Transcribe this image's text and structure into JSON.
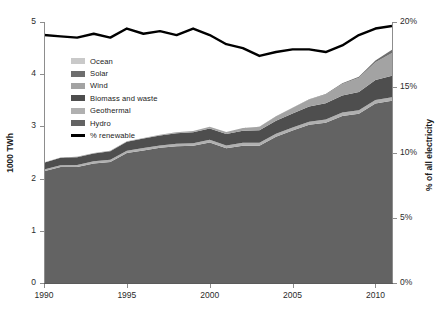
{
  "chart_data": {
    "type": "area",
    "title": "",
    "xlabel": "",
    "ylabel": "1000 TWh",
    "y2label": "% of all electricity",
    "xlim": [
      1990,
      2011
    ],
    "ylim": [
      0,
      5
    ],
    "y2lim": [
      0,
      20
    ],
    "grid": false,
    "legend_position": "upper-left-inside",
    "x": [
      1990,
      1991,
      1992,
      1993,
      1994,
      1995,
      1996,
      1997,
      1998,
      1999,
      2000,
      2001,
      2002,
      2003,
      2004,
      2005,
      2006,
      2007,
      2008,
      2009,
      2010,
      2011
    ],
    "xticks": [
      1990,
      1995,
      2000,
      2005,
      2010
    ],
    "xtick_labels": [
      "1990",
      "1995",
      "2000",
      "2005",
      "2010"
    ],
    "yticks": [
      0,
      1,
      2,
      3,
      4,
      5
    ],
    "ytick_labels": [
      "0",
      "1",
      "2",
      "3",
      "4",
      "5"
    ],
    "y2ticks": [
      0,
      5,
      10,
      15,
      20
    ],
    "y2tick_labels": [
      "0%",
      "5%",
      "10%",
      "15%",
      "20%"
    ],
    "stacked": true,
    "stack_order_bottom_to_top": [
      "Hydro",
      "Geothermal",
      "Biomass and waste",
      "Wind",
      "Solar",
      "Ocean"
    ],
    "series": [
      {
        "name": "Hydro",
        "color": "#636363",
        "axis": "left",
        "values": [
          2.14,
          2.22,
          2.22,
          2.29,
          2.32,
          2.49,
          2.54,
          2.59,
          2.62,
          2.63,
          2.69,
          2.58,
          2.63,
          2.63,
          2.8,
          2.92,
          3.03,
          3.07,
          3.2,
          3.24,
          3.44,
          3.49
        ]
      },
      {
        "name": "Geothermal",
        "color": "#b0b0b0",
        "axis": "left",
        "values": [
          0.036,
          0.038,
          0.04,
          0.042,
          0.043,
          0.045,
          0.046,
          0.046,
          0.048,
          0.049,
          0.052,
          0.053,
          0.055,
          0.056,
          0.057,
          0.058,
          0.06,
          0.062,
          0.064,
          0.067,
          0.068,
          0.069
        ]
      },
      {
        "name": "Biomass and waste",
        "color": "#4e4e4e",
        "axis": "left",
        "values": [
          0.13,
          0.14,
          0.15,
          0.15,
          0.16,
          0.17,
          0.18,
          0.19,
          0.2,
          0.21,
          0.22,
          0.22,
          0.23,
          0.24,
          0.25,
          0.27,
          0.29,
          0.31,
          0.33,
          0.35,
          0.38,
          0.41
        ]
      },
      {
        "name": "Wind",
        "color": "#a3a3a3",
        "axis": "left",
        "values": [
          0.004,
          0.005,
          0.006,
          0.007,
          0.008,
          0.01,
          0.011,
          0.013,
          0.017,
          0.022,
          0.031,
          0.038,
          0.052,
          0.064,
          0.085,
          0.104,
          0.133,
          0.171,
          0.22,
          0.276,
          0.342,
          0.437
        ]
      },
      {
        "name": "Solar",
        "color": "#6e6e6e",
        "axis": "left",
        "values": [
          0.0004,
          0.0004,
          0.0005,
          0.0005,
          0.0006,
          0.0006,
          0.0007,
          0.0008,
          0.0009,
          0.0011,
          0.0013,
          0.0016,
          0.002,
          0.0025,
          0.0032,
          0.0042,
          0.0057,
          0.0077,
          0.012,
          0.02,
          0.032,
          0.062
        ]
      },
      {
        "name": "Ocean",
        "color": "#c9c9c9",
        "axis": "left",
        "values": [
          0.0005,
          0.0005,
          0.0005,
          0.0005,
          0.0005,
          0.0005,
          0.0005,
          0.0005,
          0.0005,
          0.0005,
          0.0005,
          0.0005,
          0.0005,
          0.0005,
          0.0005,
          0.0005,
          0.0005,
          0.0005,
          0.0005,
          0.0005,
          0.0005,
          0.0005
        ]
      },
      {
        "name": "% renewable",
        "color": "#000000",
        "axis": "right",
        "type": "line",
        "values": [
          19.0,
          18.9,
          18.8,
          19.1,
          18.8,
          19.5,
          19.1,
          19.3,
          19.0,
          19.5,
          19.0,
          18.3,
          18.0,
          17.4,
          17.7,
          17.9,
          17.9,
          17.7,
          18.2,
          19.0,
          19.5,
          19.7
        ]
      }
    ]
  },
  "legend": {
    "items": [
      {
        "label": "Ocean",
        "color": "#c9c9c9",
        "kind": "swatch"
      },
      {
        "label": "Solar",
        "color": "#6e6e6e",
        "kind": "swatch"
      },
      {
        "label": "Wind",
        "color": "#a3a3a3",
        "kind": "swatch"
      },
      {
        "label": "Biomass and waste",
        "color": "#4e4e4e",
        "kind": "swatch"
      },
      {
        "label": "Geothermal",
        "color": "#b0b0b0",
        "kind": "swatch"
      },
      {
        "label": "Hydro",
        "color": "#636363",
        "kind": "swatch"
      },
      {
        "label": "% renewable",
        "color": "#000000",
        "kind": "line"
      }
    ]
  }
}
